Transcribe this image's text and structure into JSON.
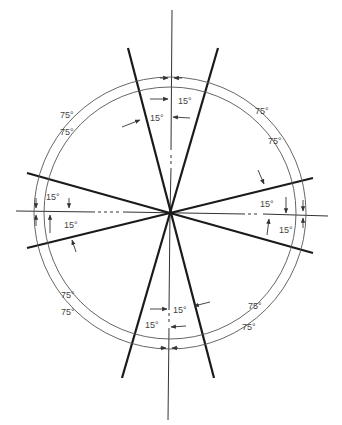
{
  "diagram": {
    "center": {
      "x": 170,
      "y": 213
    },
    "labels": {
      "top_right_inner": "15°",
      "top_left_inner": "15°",
      "left_upper": "15°",
      "left_lower": "15°",
      "right_upper": "15°",
      "right_lower": "15°",
      "bottom_right_inner": "15°",
      "bottom_left_inner": "15°",
      "upper_left_outer": "75°",
      "upper_left_inner": "75°",
      "upper_right_outer": "75°",
      "upper_right_inner": "75°",
      "lower_left_outer": "75°",
      "lower_left_inner": "75°",
      "lower_right_outer": "75°",
      "lower_right_inner": "75°"
    },
    "colors": {
      "lines": "#1a1a1a",
      "arcs": "#555555",
      "text": "#444444"
    }
  }
}
